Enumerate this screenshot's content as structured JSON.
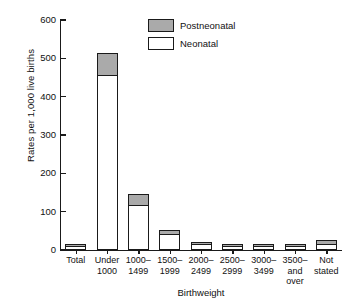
{
  "chart_data": {
    "type": "bar",
    "title": "",
    "xlabel": "Birthweight",
    "ylabel": "Rates per 1,000 live births",
    "ylim": [
      0,
      600
    ],
    "yticks": [
      0,
      100,
      200,
      300,
      400,
      500,
      600
    ],
    "grid": false,
    "stacked": true,
    "legend_position": "top-center",
    "categories": [
      "Total",
      "Under\n1000",
      "1000–\n1499",
      "1500–\n1999",
      "2000–\n2499",
      "2500–\n2999",
      "3000–\n3499",
      "3500–\nand\nover",
      "Not\nstated"
    ],
    "series": [
      {
        "name": "Neonatal",
        "color": "#ffffff",
        "values": [
          5,
          455,
          115,
          38,
          12,
          6,
          3,
          2,
          14
        ]
      },
      {
        "name": "Postneonatal",
        "color": "#aaaaaa",
        "values": [
          3,
          60,
          32,
          15,
          7,
          5,
          4,
          4,
          11
        ]
      }
    ],
    "totals": [
      8,
      515,
      147,
      53,
      19,
      11,
      7,
      6,
      25
    ]
  },
  "axes": {
    "y_label": "Rates per 1,000 live births",
    "x_label": "Birthweight",
    "y_tick_labels": [
      "0",
      "100",
      "200",
      "300",
      "400",
      "500",
      "600"
    ]
  },
  "legend": {
    "items": [
      {
        "label": "Postneonatal",
        "swatch": "gray-swatch"
      },
      {
        "label": "Neonatal",
        "swatch": "white-swatch"
      }
    ]
  }
}
